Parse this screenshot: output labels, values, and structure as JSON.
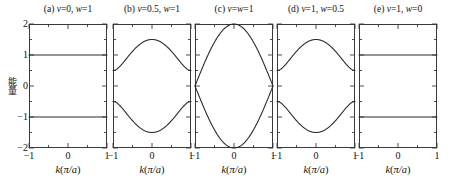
{
  "figure": {
    "background": "#ffffff",
    "curve_color": "#2b2b2b",
    "axis_color": "#3a3a3a"
  },
  "axes": {
    "ylabel": "能量",
    "xlabel_prefix": "k",
    "xlabel_paren": "(π/a)",
    "xlabel_full": "k(π/a)",
    "ytick_labels": [
      "2",
      "1",
      "0",
      "−1",
      "−2"
    ],
    "ytick_values": [
      2,
      1,
      0,
      -1,
      -2
    ],
    "xtick_labels": [
      "−1",
      "0",
      "1"
    ],
    "xtick_values": [
      -1,
      0,
      1
    ],
    "ylim": [
      -2,
      2
    ],
    "xlim": [
      -1,
      1
    ]
  },
  "panels": [
    {
      "id": "a",
      "tag": "(a)",
      "title": "(a) v=0, w=1",
      "v": 0,
      "w": 1,
      "gap_at_edge": 1.0,
      "peak_at_center": 1.0
    },
    {
      "id": "b",
      "tag": "(b)",
      "title": "(b) v=0.5, w=1",
      "v": 0.5,
      "w": 1,
      "gap_at_edge": 0.5,
      "peak_at_center": 1.5
    },
    {
      "id": "c",
      "tag": "(c)",
      "title": "(c) v=w=1",
      "v": 1,
      "w": 1,
      "gap_at_edge": 0.0,
      "peak_at_center": 2.0
    },
    {
      "id": "d",
      "tag": "(d)",
      "title": "(d) v=1, w=0.5",
      "v": 1,
      "w": 0.5,
      "gap_at_edge": 0.5,
      "peak_at_center": 1.5
    },
    {
      "id": "e",
      "tag": "(e)",
      "title": "(e) v=1, w=0",
      "v": 1,
      "w": 0,
      "gap_at_edge": 1.0,
      "peak_at_center": 1.0
    }
  ],
  "chart_data": {
    "type": "line",
    "title": "",
    "xlabel": "k(π/a)",
    "ylabel": "能量",
    "xlim": [
      -1,
      1
    ],
    "ylim": [
      -2,
      2
    ],
    "grid": false,
    "legend": "none",
    "subplots": [
      {
        "panel": "a",
        "label": "(a) v=0, w=1",
        "params": {
          "v": 0,
          "w": 1
        },
        "series": [
          {
            "name": "upper band",
            "x": [
              -1,
              -0.75,
              -0.5,
              -0.25,
              0,
              0.25,
              0.5,
              0.75,
              1
            ],
            "values": [
              1,
              1,
              1,
              1,
              1,
              1,
              1,
              1,
              1
            ]
          },
          {
            "name": "lower band",
            "x": [
              -1,
              -0.75,
              -0.5,
              -0.25,
              0,
              0.25,
              0.5,
              0.75,
              1
            ],
            "values": [
              -1,
              -1,
              -1,
              -1,
              -1,
              -1,
              -1,
              -1,
              -1
            ]
          }
        ]
      },
      {
        "panel": "b",
        "label": "(b) v=0.5, w=1",
        "params": {
          "v": 0.5,
          "w": 1
        },
        "series": [
          {
            "name": "upper band",
            "x": [
              -1,
              -0.75,
              -0.5,
              -0.25,
              0,
              0.25,
              0.5,
              0.75,
              1
            ],
            "values": [
              0.5,
              0.64,
              0.97,
              1.32,
              1.5,
              1.32,
              0.97,
              0.64,
              0.5
            ]
          },
          {
            "name": "lower band",
            "x": [
              -1,
              -0.75,
              -0.5,
              -0.25,
              0,
              0.25,
              0.5,
              0.75,
              1
            ],
            "values": [
              -0.5,
              -0.64,
              -0.97,
              -1.32,
              -1.5,
              -1.32,
              -0.97,
              -0.64,
              -0.5
            ]
          }
        ]
      },
      {
        "panel": "c",
        "label": "(c) v=w=1",
        "params": {
          "v": 1,
          "w": 1
        },
        "series": [
          {
            "name": "upper band",
            "x": [
              -1,
              -0.75,
              -0.5,
              -0.25,
              0,
              0.25,
              0.5,
              0.75,
              1
            ],
            "values": [
              0,
              0.77,
              1.41,
              1.85,
              2,
              1.85,
              1.41,
              0.77,
              0
            ]
          },
          {
            "name": "lower band",
            "x": [
              -1,
              -0.75,
              -0.5,
              -0.25,
              0,
              0.25,
              0.5,
              0.75,
              1
            ],
            "values": [
              0,
              -0.77,
              -1.41,
              -1.85,
              -2,
              -1.85,
              -1.41,
              -0.77,
              0
            ]
          }
        ]
      },
      {
        "panel": "d",
        "label": "(d) v=1, w=0.5",
        "params": {
          "v": 1,
          "w": 0.5
        },
        "series": [
          {
            "name": "upper band",
            "x": [
              -1,
              -0.75,
              -0.5,
              -0.25,
              0,
              0.25,
              0.5,
              0.75,
              1
            ],
            "values": [
              0.5,
              0.64,
              0.97,
              1.32,
              1.5,
              1.32,
              0.97,
              0.64,
              0.5
            ]
          },
          {
            "name": "lower band",
            "x": [
              -1,
              -0.75,
              -0.5,
              -0.25,
              0,
              0.25,
              0.5,
              0.75,
              1
            ],
            "values": [
              -0.5,
              -0.64,
              -0.97,
              -1.32,
              -1.5,
              -1.32,
              -0.97,
              -0.64,
              -0.5
            ]
          }
        ]
      },
      {
        "panel": "e",
        "label": "(e) v=1, w=0",
        "params": {
          "v": 1,
          "w": 0
        },
        "series": [
          {
            "name": "upper band",
            "x": [
              -1,
              -0.75,
              -0.5,
              -0.25,
              0,
              0.25,
              0.5,
              0.75,
              1
            ],
            "values": [
              1,
              1,
              1,
              1,
              1,
              1,
              1,
              1,
              1
            ]
          },
          {
            "name": "lower band",
            "x": [
              -1,
              -0.75,
              -0.5,
              -0.25,
              0,
              0.25,
              0.5,
              0.75,
              1
            ],
            "values": [
              -1,
              -1,
              -1,
              -1,
              -1,
              -1,
              -1,
              -1,
              -1
            ]
          }
        ]
      }
    ]
  }
}
